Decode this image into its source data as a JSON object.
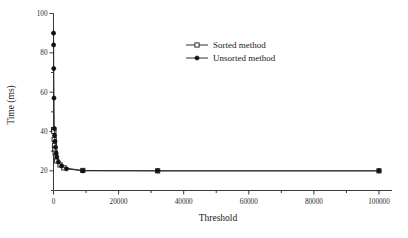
{
  "figure": {
    "title": "",
    "background_color": "#ffffff",
    "ink_color": "#2e2e2e"
  },
  "axes": {
    "x": {
      "label": "Threshold",
      "tick_labels": [
        "0",
        "20000",
        "40000",
        "60000",
        "80000",
        "100000"
      ],
      "tick_values": [
        0,
        20000,
        40000,
        60000,
        80000,
        100000
      ],
      "min": 0,
      "max": 104000,
      "minor_ticks": true
    },
    "y": {
      "label": "Time (ms)",
      "tick_labels": [
        "20",
        "40",
        "60",
        "80",
        "100"
      ],
      "tick_values": [
        20,
        40,
        60,
        80,
        100
      ],
      "min": 10,
      "max": 100,
      "minor_ticks": true
    }
  },
  "legend": {
    "position": "top-center",
    "entries": [
      {
        "label": "Sorted method",
        "marker": "open-square",
        "marker_color": "#ffffff",
        "line_color": "#2e2e2e"
      },
      {
        "label": "Unsorted method",
        "marker": "filled-circle",
        "marker_color": "#101010",
        "line_color": "#2e2e2e"
      }
    ]
  },
  "chart_data": {
    "type": "line",
    "title": "",
    "xlabel": "Threshold",
    "ylabel": "Time (ms)",
    "xlim": [
      0,
      104000
    ],
    "ylim": [
      10,
      100
    ],
    "grid": false,
    "legend_position": "top-center",
    "xticks": [
      0,
      20000,
      40000,
      60000,
      80000,
      100000
    ],
    "yticks": [
      20,
      40,
      60,
      80,
      100
    ],
    "series": [
      {
        "name": "Sorted method",
        "marker": "open-square",
        "x": [
          50,
          100,
          200,
          300,
          400,
          500,
          700,
          1000,
          2000,
          3200,
          9000,
          32000,
          100000
        ],
        "y": [
          41.0,
          40.0,
          36.0,
          33.0,
          31.0,
          29.0,
          27.0,
          25.0,
          23.0,
          21.5,
          20.2,
          20.0,
          20.0
        ]
      },
      {
        "name": "Unsorted method",
        "marker": "filled-circle",
        "x": [
          20,
          40,
          80,
          150,
          250,
          350,
          450,
          600,
          800,
          1000,
          1500,
          2500,
          4000,
          9000,
          32000,
          100000
        ],
        "y": [
          90.0,
          84.0,
          72.0,
          57.0,
          41.5,
          38.0,
          35.0,
          32.0,
          29.0,
          27.0,
          24.5,
          22.5,
          21.0,
          20.0,
          20.0,
          20.0
        ]
      }
    ]
  }
}
